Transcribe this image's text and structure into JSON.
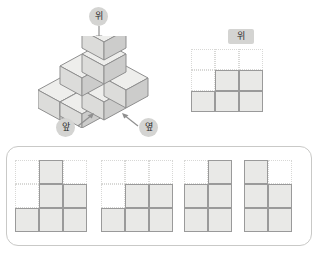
{
  "labels": {
    "top": "위",
    "front": "앞",
    "side": "옆"
  },
  "colors": {
    "cell_fill": "#e9e9e7",
    "cell_border": "#9a9a9a",
    "empty_border": "#d8d8d6",
    "badge_bg": "#d4d4d2",
    "panel_border": "#c9c9c7",
    "cube_top": "#eeeeec",
    "cube_left": "#dcdcda",
    "cube_right": "#cccccb",
    "cube_edge": "#8f8f8f"
  },
  "solid": {
    "description": "isometric-cube-stack",
    "layers": [
      {
        "name": "bottom-layer",
        "cube_count": 6
      },
      {
        "name": "middle-layer",
        "cube_count": 2
      },
      {
        "name": "top-layer",
        "cube_count": 1
      }
    ],
    "total_cubes": 9
  },
  "top_view": {
    "badge": "위",
    "rows": 3,
    "cols": 3,
    "cells": [
      [
        0,
        0,
        0
      ],
      [
        0,
        1,
        1
      ],
      [
        1,
        1,
        1
      ]
    ]
  },
  "options": [
    {
      "id": "option-1",
      "rows": 3,
      "cols": 3,
      "cells": [
        [
          0,
          1,
          0
        ],
        [
          0,
          1,
          1
        ],
        [
          1,
          1,
          1
        ]
      ]
    },
    {
      "id": "option-2",
      "rows": 3,
      "cols": 3,
      "cells": [
        [
          0,
          0,
          0
        ],
        [
          0,
          1,
          1
        ],
        [
          1,
          1,
          1
        ]
      ]
    },
    {
      "id": "option-3",
      "rows": 3,
      "cols": 2,
      "cells": [
        [
          0,
          1
        ],
        [
          1,
          1
        ],
        [
          1,
          1
        ]
      ]
    },
    {
      "id": "option-4",
      "rows": 3,
      "cols": 2,
      "cells": [
        [
          1,
          0
        ],
        [
          1,
          1
        ],
        [
          1,
          1
        ]
      ]
    }
  ]
}
